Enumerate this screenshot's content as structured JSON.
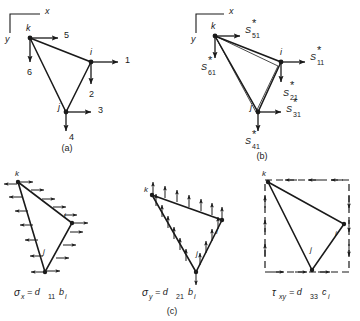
{
  "figure": {
    "ink_color": "#1a1a1a",
    "background": "#ffffff",
    "captions": {
      "a": "(a)",
      "b": "(b)",
      "c": "(c)"
    }
  },
  "axes": {
    "x_label": "x",
    "y_label": "y"
  },
  "panel_a": {
    "caption": "(a)",
    "nodes": [
      {
        "name": "k",
        "label": "k"
      },
      {
        "name": "i",
        "label": "i"
      },
      {
        "name": "j",
        "label": "j"
      }
    ],
    "force_labels": [
      {
        "name": "force-1",
        "label": "1",
        "at_node": "i",
        "direction": "right"
      },
      {
        "name": "force-2",
        "label": "2",
        "at_node": "i",
        "direction": "down"
      },
      {
        "name": "force-3",
        "label": "3",
        "at_node": "j",
        "direction": "right"
      },
      {
        "name": "force-4",
        "label": "4",
        "at_node": "j",
        "direction": "down"
      },
      {
        "name": "force-5",
        "label": "5",
        "at_node": "k",
        "direction": "right"
      },
      {
        "name": "force-6",
        "label": "6",
        "at_node": "k",
        "direction": "down"
      }
    ]
  },
  "panel_b": {
    "caption": "(b)",
    "nodes": [
      {
        "name": "k",
        "label": "k"
      },
      {
        "name": "i",
        "label": "i"
      },
      {
        "name": "j",
        "label": "j"
      }
    ],
    "force_labels": [
      {
        "name": "force-s11",
        "base": "S",
        "star": "*",
        "sub": "11",
        "at_node": "i",
        "direction": "right"
      },
      {
        "name": "force-s21",
        "base": "S",
        "star": "*",
        "sub": "21",
        "at_node": "i",
        "direction": "down"
      },
      {
        "name": "force-s31",
        "base": "S",
        "star": "*",
        "sub": "31",
        "at_node": "j",
        "direction": "right"
      },
      {
        "name": "force-s41",
        "base": "S",
        "star": "*",
        "sub": "41",
        "at_node": "j",
        "direction": "down"
      },
      {
        "name": "force-s51",
        "base": "S",
        "star": "*",
        "sub": "51",
        "at_node": "k",
        "direction": "right"
      },
      {
        "name": "force-s61",
        "base": "S",
        "star": "*",
        "sub": "61",
        "at_node": "k",
        "direction": "down"
      }
    ]
  },
  "panel_c": {
    "caption": "(c)",
    "subplots": [
      {
        "name": "sigma-x",
        "formula_main": "σ",
        "formula_sub1": "x",
        "formula_eq": "= d",
        "formula_sub2": "11",
        "formula_tail": "b",
        "formula_sub3": "i",
        "formula_plain": "σx = d11 bi",
        "arrow_direction": "horizontal",
        "nodes": [
          {
            "name": "k",
            "label": "k"
          },
          {
            "name": "i",
            "label": "i"
          },
          {
            "name": "j",
            "label": "j"
          }
        ]
      },
      {
        "name": "sigma-y",
        "formula_main": "σ",
        "formula_sub1": "y",
        "formula_eq": "= d",
        "formula_sub2": "21",
        "formula_tail": "b",
        "formula_sub3": "i",
        "formula_plain": "σy = d21 bi",
        "arrow_direction": "vertical",
        "nodes": [
          {
            "name": "k",
            "label": "k"
          },
          {
            "name": "i",
            "label": "i"
          },
          {
            "name": "j",
            "label": "j"
          }
        ]
      },
      {
        "name": "tau-xy",
        "formula_main": "τ",
        "formula_sub1": "xy",
        "formula_eq": "= d",
        "formula_sub2": "33",
        "formula_tail": "c",
        "formula_sub3": "i",
        "formula_plain": "τxy = d33 ci",
        "arrow_direction": "shear",
        "nodes": [
          {
            "name": "k",
            "label": "k"
          },
          {
            "name": "i",
            "label": "i"
          },
          {
            "name": "j",
            "label": "j"
          }
        ]
      }
    ]
  }
}
